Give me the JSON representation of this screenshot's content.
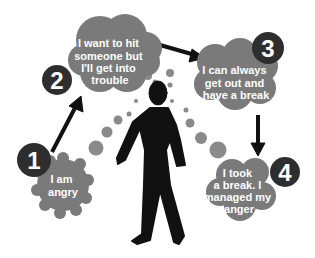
{
  "diagram": {
    "colors": {
      "cloud": "#7a7a7a",
      "badge": "#2e2e2e",
      "figure": "#111111",
      "arrow": "#111111",
      "dots": "#8a8a8a",
      "text": "#ffffff"
    },
    "steps": [
      {
        "number": "1",
        "lines": [
          "I am",
          "angry"
        ]
      },
      {
        "number": "2",
        "lines": [
          "I want to hit",
          "someone but",
          "I'll get into",
          "trouble"
        ]
      },
      {
        "number": "3",
        "lines": [
          "I can always",
          "get out and",
          "have a break"
        ]
      },
      {
        "number": "4",
        "lines": [
          "I took",
          "a break. I",
          "managed my",
          "anger"
        ]
      }
    ],
    "figure_icon": "walking-person-icon"
  }
}
